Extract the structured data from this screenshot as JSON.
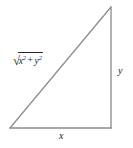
{
  "figure": {
    "name": "right-triangle-pythagorean",
    "background_color": "#ffffff",
    "stroke_color": "#8a8a8a",
    "text_color": "#1a1a1a",
    "geometry": {
      "bottom_left": [
        10,
        128
      ],
      "bottom_right": [
        111,
        128
      ],
      "top_right": [
        111,
        7
      ],
      "stroke_width": 1.2
    },
    "labels": {
      "hypotenuse": {
        "radical_sign": "√",
        "base1": "x",
        "exp1": "2",
        "operator": "+",
        "base2": "y",
        "exp2": "2",
        "plain_text": "√(x² + y²)"
      },
      "vertical_leg": "y",
      "horizontal_leg": "x"
    }
  }
}
